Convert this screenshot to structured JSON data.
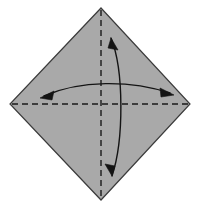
{
  "figure": {
    "title": "Origami fold diagram",
    "canvas": {
      "width": 200,
      "height": 208,
      "background": "#ffffff"
    }
  },
  "colors": {
    "paper_fill": "#a9a9a9",
    "paper_stroke": "#3b3b3b",
    "fold_line": "#1a1a1a",
    "arrow": "#141414",
    "background": "#ffffff"
  },
  "shapes": {
    "paper": {
      "name": "diamond-sheet",
      "kind": "polygon",
      "points": "101,8 190,104 101,200 10,104",
      "vertices": {
        "top": [
          101,
          8
        ],
        "right": [
          190,
          104
        ],
        "bottom": [
          101,
          200
        ],
        "left": [
          10,
          104
        ]
      },
      "fill": "#a9a9a9",
      "stroke": "#3b3b3b",
      "stroke_width": 1.2
    },
    "fold_lines": [
      {
        "name": "vertical-fold-line",
        "orientation": "vertical",
        "from": [
          101,
          10
        ],
        "to": [
          101,
          198
        ],
        "style": "dashed",
        "dash": "6,4",
        "stroke": "#1a1a1a",
        "stroke_width": 1.4
      },
      {
        "name": "horizontal-fold-line",
        "orientation": "horizontal",
        "from": [
          12,
          104
        ],
        "to": [
          188,
          104
        ],
        "style": "dashed",
        "dash": "6,4",
        "stroke": "#1a1a1a",
        "stroke_width": 1.4
      }
    ],
    "arrows": [
      {
        "name": "vertical-fold-arrow",
        "orientation": "vertical",
        "double_headed": true,
        "bows_toward": "right",
        "path": "M 112,176 C 124,140 124,70 111,38",
        "start": [
          112,
          176
        ],
        "end": [
          111,
          38
        ],
        "control_points": [
          [
            124,
            140
          ],
          [
            124,
            70
          ]
        ],
        "stroke": "#141414",
        "stroke_width": 1.4,
        "head_start": {
          "points": "111,38 118,50 108,48",
          "angle_deg": 200
        },
        "head_end": {
          "points": "112,176 105,164 115,166",
          "angle_deg": 20
        }
      },
      {
        "name": "horizontal-fold-arrow",
        "orientation": "horizontal",
        "double_headed": true,
        "bows_toward": "up",
        "path": "M 44,96 C 80,80 130,80 170,93",
        "start": [
          44,
          96
        ],
        "end": [
          170,
          93
        ],
        "control_points": [
          [
            80,
            80
          ],
          [
            130,
            80
          ]
        ],
        "stroke": "#141414",
        "stroke_width": 1.4,
        "head_start": {
          "points": "40,98 54,91 52,100",
          "angle_deg": 160
        },
        "head_end": {
          "points": "174,95 160,88 161,97",
          "angle_deg": 20
        }
      }
    ]
  },
  "labels": {
    "step_number": "",
    "caption": "",
    "annotations": []
  }
}
